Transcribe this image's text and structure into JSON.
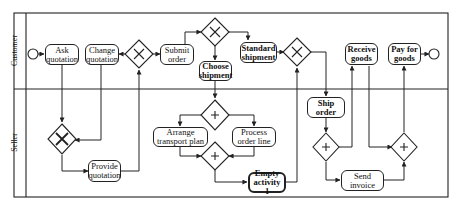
{
  "diagram": {
    "type": "BPMN collaboration",
    "lanes": [
      {
        "id": "customer",
        "label": "Customer"
      },
      {
        "id": "seller",
        "label": "Seller"
      }
    ],
    "tasks": {
      "ask_quotation": "Ask quotation",
      "change_quotation": "Change quotation",
      "submit_order": "Submit order",
      "choose_shipment": "Choose shipment",
      "standard_shipment": "Standard shipment",
      "receive_goods": "Receive goods",
      "pay_for_goods": "Pay for goods",
      "provide_quotation": "Provide quotation",
      "arrange_transport_plan": "Arrange transport plan",
      "process_order_line": "Process order line",
      "empty_activity_1": "Empty activity 1",
      "ship_order": "Ship order",
      "send_invoice": "Send invoice"
    },
    "gateways": {
      "exclusive_symbol": "X",
      "parallel_symbol": "+"
    },
    "colors": {
      "stroke": "#222222",
      "background": "#ffffff"
    }
  }
}
